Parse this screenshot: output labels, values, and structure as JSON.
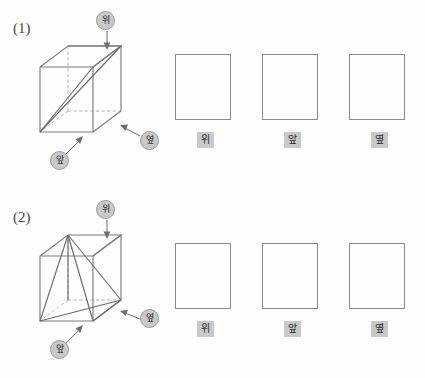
{
  "page": {
    "background_color": "#fdfdfd",
    "ink_color": "#4a4a4a",
    "badge_color": "#c9c9c9",
    "solid_line_color": "#7a7a7a",
    "dashed_line_color": "#b0aaa8",
    "cut_line_color": "#6b6b6b"
  },
  "labels": {
    "top": "위",
    "front": "앞",
    "side": "옆"
  },
  "problems": [
    {
      "number": "(1)",
      "figure": {
        "name": "cube-with-diagonal-plane",
        "description": "정육면체의 한 대각 평면으로 자른 입체",
        "callouts": [
          {
            "name": "callout-top",
            "label": "위",
            "direction": "down"
          },
          {
            "name": "callout-front",
            "label": "앞",
            "direction": "up-right"
          },
          {
            "name": "callout-side",
            "label": "옆",
            "direction": "left"
          }
        ]
      },
      "views": [
        {
          "name": "view-top",
          "label": "위",
          "content": ""
        },
        {
          "name": "view-front",
          "label": "앞",
          "content": ""
        },
        {
          "name": "view-side",
          "label": "옆",
          "content": ""
        }
      ]
    },
    {
      "number": "(2)",
      "figure": {
        "name": "cube-with-triangular-cut",
        "description": "정육면체의 한 꼭짓점에서 두 모서리로 자른 입체",
        "callouts": [
          {
            "name": "callout-top",
            "label": "위",
            "direction": "down"
          },
          {
            "name": "callout-front",
            "label": "앞",
            "direction": "up-right"
          },
          {
            "name": "callout-side",
            "label": "옆",
            "direction": "left"
          }
        ]
      },
      "views": [
        {
          "name": "view-top",
          "label": "위",
          "content": ""
        },
        {
          "name": "view-front",
          "label": "앞",
          "content": ""
        },
        {
          "name": "view-side",
          "label": "옆",
          "content": ""
        }
      ]
    }
  ]
}
